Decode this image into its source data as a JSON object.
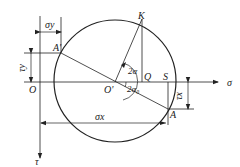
{
  "diagram": {
    "axes": {
      "horizontal_label": "σ",
      "vertical_label": "τ",
      "origin_label": "O"
    },
    "points": {
      "center": "O'",
      "A": "A",
      "A_prime": "A'",
      "K": "K",
      "Q": "Q",
      "S": "S"
    },
    "angles": {
      "two_alpha": "2α",
      "two_alpha0": "2α₀"
    },
    "dimensions": {
      "sigma_x": "σx",
      "sigma_y": "σy",
      "tau_x": "τx",
      "tau_y": "τy"
    },
    "colors": {
      "line": "#222222",
      "background": "#ffffff"
    }
  }
}
